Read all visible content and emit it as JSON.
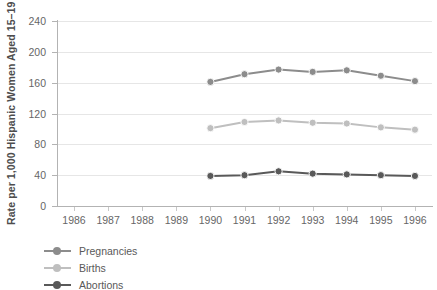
{
  "chart_data": {
    "type": "line",
    "title": "",
    "xlabel": "",
    "ylabel": "Rate per 1,000 Hispanic Women Aged 15–19",
    "categories": [
      1986,
      1987,
      1988,
      1989,
      1990,
      1991,
      1992,
      1993,
      1994,
      1995,
      1996
    ],
    "xticklabels": [
      "1986",
      "1987",
      "1988",
      "1989",
      "1990",
      "1991",
      "1992",
      "1993",
      "1994",
      "1995",
      "1996"
    ],
    "yticklabels": [
      "0",
      "40",
      "80",
      "120",
      "160",
      "200",
      "240"
    ],
    "yticks": [
      0,
      40,
      80,
      120,
      160,
      200,
      240
    ],
    "ylim": [
      0,
      240
    ],
    "grid": "horizontal",
    "legend_position": "below-left",
    "series": [
      {
        "name": "Pregnancies",
        "color": "#8c8c8c",
        "x": [
          1990,
          1991,
          1992,
          1993,
          1994,
          1995,
          1996
        ],
        "values": [
          161,
          171,
          177,
          174,
          176,
          169,
          162
        ]
      },
      {
        "name": "Births",
        "color": "#bfbfbf",
        "x": [
          1990,
          1991,
          1992,
          1993,
          1994,
          1995,
          1996
        ],
        "values": [
          101,
          109,
          111,
          108,
          107,
          102,
          99
        ]
      },
      {
        "name": "Abortions",
        "color": "#595959",
        "x": [
          1990,
          1991,
          1992,
          1993,
          1994,
          1995,
          1996
        ],
        "values": [
          39,
          40,
          45,
          42,
          41,
          40,
          39
        ]
      }
    ]
  },
  "legend": {
    "items": [
      {
        "label": "Pregnancies"
      },
      {
        "label": "Births"
      },
      {
        "label": "Abortions"
      }
    ]
  },
  "axes": {
    "y_title": "Rate per 1,000 Hispanic Women Aged 15–19"
  },
  "colors": {
    "pregnancies": "#8c8c8c",
    "births": "#bfbfbf",
    "abortions": "#595959",
    "gridline": "#e6e6e6",
    "axis": "#b3b3b3",
    "tick_text": "#666666",
    "title_text": "#4d4d4d"
  }
}
